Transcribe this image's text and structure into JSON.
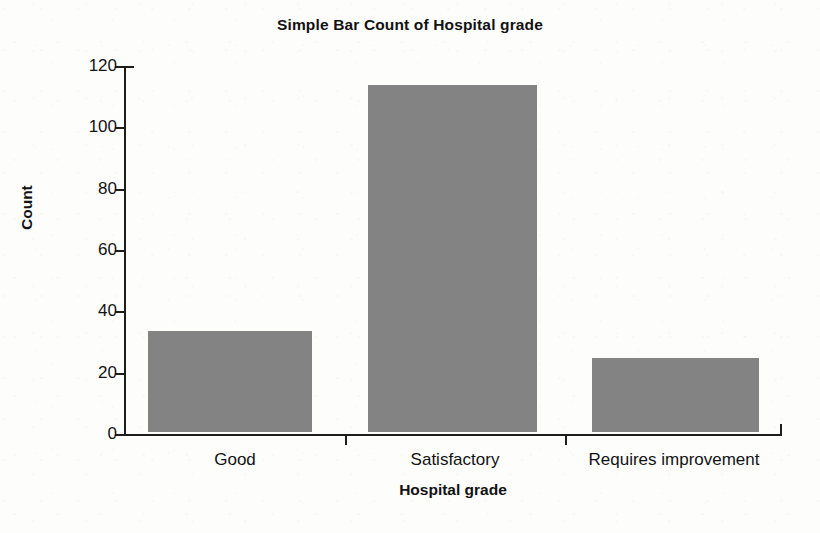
{
  "figure": {
    "background_color": "#fdfdfc",
    "axis_color": "#1d1d1d",
    "bar_color": "#838383"
  },
  "chart_data": {
    "type": "bar",
    "title": "Simple Bar Count of Hospital grade",
    "xlabel": "Hospital grade",
    "ylabel": "Count",
    "categories": [
      "Good",
      "Satisfactory",
      "Requires improvement"
    ],
    "values": [
      33,
      113,
      24
    ],
    "series": [
      {
        "name": "Count",
        "values": [
          33,
          113,
          24
        ],
        "color": "#838383"
      }
    ],
    "ylim": [
      0,
      120
    ],
    "yticks": [
      0,
      20,
      40,
      60,
      80,
      100,
      120
    ],
    "ytick_labels": [
      "0",
      "20",
      "40",
      "60",
      "80",
      "100",
      "120"
    ],
    "xtick_labels": [
      "Good",
      "Satisfactory",
      "Requires improvement"
    ],
    "grid": false,
    "legend": false,
    "legend_position": "none"
  }
}
